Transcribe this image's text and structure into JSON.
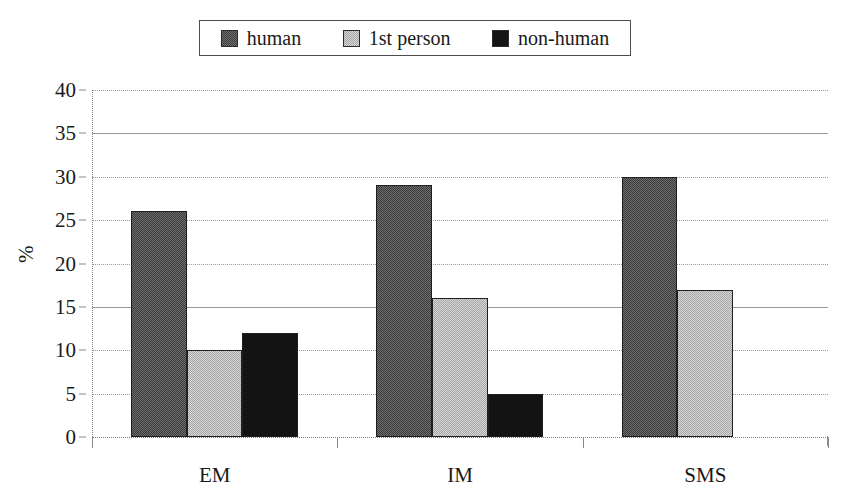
{
  "legend": {
    "position": "top",
    "entries": [
      {
        "label": "human",
        "swatch": "checkered-dark-swatch",
        "color": "#4a4a4a"
      },
      {
        "label": "1st person",
        "swatch": "checkered-light-swatch",
        "color": "#bdbdbd"
      },
      {
        "label": "non-human",
        "swatch": "solid-black-swatch",
        "color": "#131313"
      }
    ]
  },
  "axes": {
    "y_title": "%",
    "y_ticks": [
      "0",
      "5",
      "10",
      "15",
      "20",
      "25",
      "30",
      "35",
      "40"
    ],
    "x_ticks": [
      "EM",
      "IM",
      "SMS"
    ]
  },
  "chart_data": {
    "type": "bar",
    "title": "",
    "xlabel": "",
    "ylabel": "%",
    "ylim": [
      0,
      40
    ],
    "ytick_step": 5,
    "grid": true,
    "grid_style": "horizontal dotted, solid at 15 and 35",
    "legend_position": "top",
    "categories": [
      "EM",
      "IM",
      "SMS"
    ],
    "series": [
      {
        "name": "human",
        "values": [
          26,
          29,
          30
        ]
      },
      {
        "name": "1st person",
        "values": [
          10,
          16,
          17
        ]
      },
      {
        "name": "non-human",
        "values": [
          12,
          5,
          0
        ]
      }
    ]
  }
}
